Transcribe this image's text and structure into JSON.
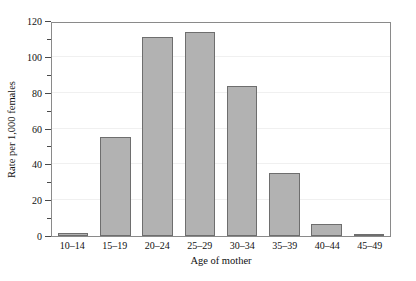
{
  "chart_data": {
    "type": "bar",
    "title": "",
    "subtitle": "",
    "xlabel": "Age of mother",
    "ylabel": "Rate per 1,000 females",
    "categories": [
      "10–14",
      "15–19",
      "20–24",
      "25–29",
      "30–34",
      "35–39",
      "40–44",
      "45–49"
    ],
    "values": [
      1.5,
      55,
      111,
      114,
      84,
      35,
      6.5,
      0.6
    ],
    "ylim": [
      0,
      120
    ],
    "ytick_labels": [
      "0",
      "20",
      "40",
      "60",
      "80",
      "100",
      "120"
    ],
    "ytick_values": [
      0,
      20,
      40,
      60,
      80,
      100,
      120
    ],
    "yminor_tick_values": [
      10,
      30,
      50,
      70,
      90,
      110
    ],
    "grid": true,
    "grid_axis": "y",
    "legend": false,
    "legend_position": "none",
    "bar_color": "#b2b2b2",
    "bar_edge_color": "#6e6e6e",
    "frame_color": "#8a8a8a",
    "grid_color": "#f0f0f0",
    "background_color": "#ffffff"
  }
}
